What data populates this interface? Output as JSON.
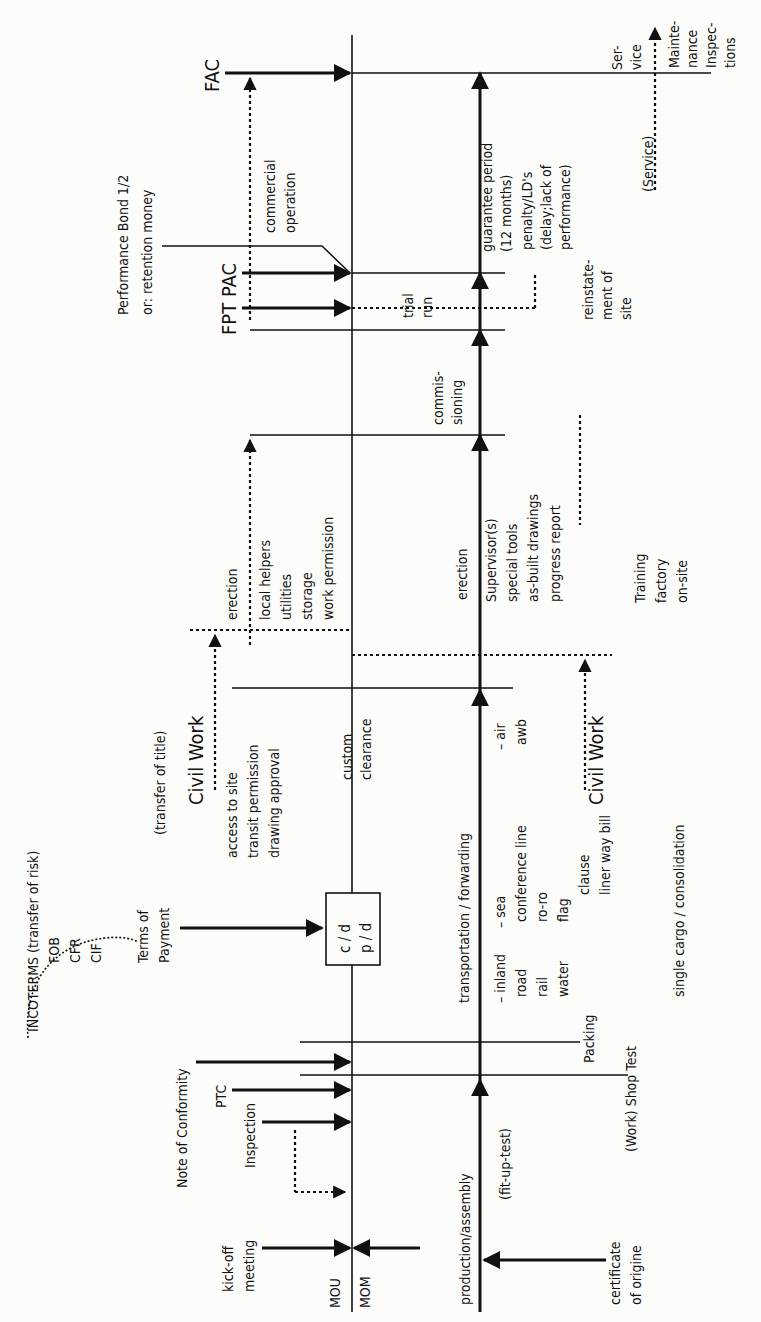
{
  "diagram": {
    "orientation": "rotated-90-ccw",
    "labels": {
      "fac": "FAC",
      "fpt_pac": "FPT PAC",
      "performance_bond_1": "Performance Bond 1/2",
      "performance_bond_2": "or: retention money",
      "commercial_1": "commercial",
      "commercial_2": "operation",
      "trial_1": "trial",
      "trial_2": "run",
      "commissioning_1": "commis-",
      "commissioning_2": "sioning",
      "guarantee_1": "guarantee period",
      "guarantee_2": "(12 months)",
      "penalty_1": "penalty/LD's",
      "penalty_2": "(delay;lack of",
      "penalty_3": "performance)",
      "reinstatement_1": "reinstate-",
      "reinstatement_2": "ment of",
      "reinstatement_3": "site",
      "service_1": "Ser-",
      "service_2": "vice",
      "service_paren": "(Service)",
      "maintenance_1": "Mainte-",
      "maintenance_2": "nance",
      "inspections_1": "Inspec-",
      "inspections_2": "tions",
      "erection_top": "erection",
      "local_helpers": "local helpers",
      "utilities": "utilities",
      "storage": "storage",
      "work_permission": "work permission",
      "erection_bottom": "erection",
      "supervisors": "Supervisor(s)",
      "special_tools": "special tools",
      "as_built": "as-built drawings",
      "progress_report": "progress report",
      "training": "Training",
      "factory": "factory",
      "on_site": "on-site",
      "civil_work_top": "Civil Work",
      "civil_work_bottom": "Civil Work",
      "transfer_of_title": "(transfer of title)",
      "access_to_site": "access to site",
      "transit_permission": "transit permission",
      "drawing_approval": "drawing approval",
      "custom_1": "custom",
      "custom_2": "clearance",
      "incoterms": "INCOTERMS (transfer of risk)",
      "fob": "FOB",
      "cfr": "CFR",
      "cif": "CIF",
      "terms_1": "Terms of",
      "terms_2": "Payment",
      "box_1": "c / d",
      "box_2": "p / d",
      "transport": "transportation / forwarding",
      "inland": "– inland",
      "road": "road",
      "rail": "rail",
      "water": "water",
      "sea": "– sea",
      "conference_line": "conference line",
      "ro_ro": "ro-ro",
      "flag": "flag",
      "clause": "clause",
      "liner_way_bill": "liner way bill",
      "air": "– air",
      "awb": "awb",
      "single_cargo": "single cargo / consolidation",
      "note_conformity": "Note of Conformity",
      "ptc": "PTC",
      "inspection": "Inspection",
      "packing": "Packing",
      "shop_test": "(Work) Shop Test",
      "production": "production/assembly",
      "fit_up": "(fit-up-test)",
      "kickoff_1": "kick-off",
      "kickoff_2": "meeting",
      "mou": "MOU",
      "mom": "MOM",
      "cert_1": "certificate",
      "cert_2": "of origine"
    }
  }
}
